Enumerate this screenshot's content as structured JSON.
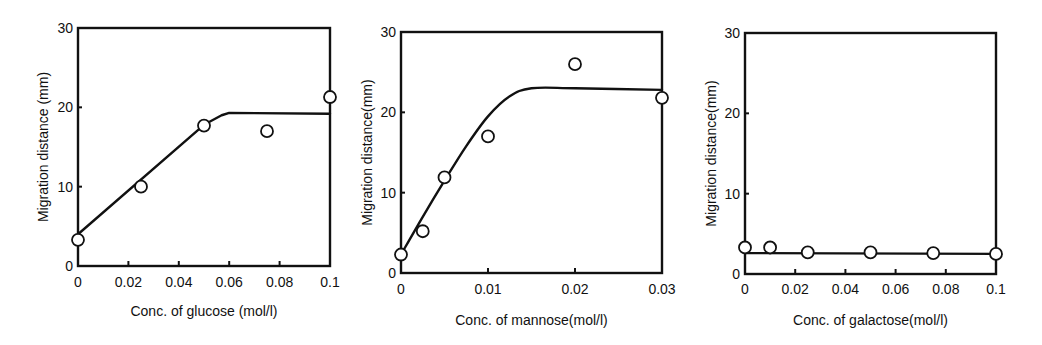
{
  "chart_data": [
    {
      "type": "scatter",
      "title": "",
      "xlabel": "Conc. of glucose (mol/l)",
      "ylabel": "Migration distance (mm)",
      "xlim": [
        0,
        0.1
      ],
      "ylim": [
        0,
        30
      ],
      "xticks": [
        0,
        0.02,
        0.04,
        0.06,
        0.08,
        0.1
      ],
      "xtick_labels": [
        "0",
        "0.02",
        "0.04",
        "0.06",
        "0.08",
        "0.1"
      ],
      "yticks": [
        0,
        10,
        20,
        30
      ],
      "ytick_labels": [
        "0",
        "10",
        "20",
        "30"
      ],
      "grid": false,
      "legend": null,
      "series": [
        {
          "name": "measured",
          "marker": "open-circle",
          "x": [
            0,
            0.025,
            0.05,
            0.075,
            0.1
          ],
          "y": [
            3.3,
            10.0,
            17.7,
            17.0,
            21.3
          ]
        },
        {
          "name": "fit",
          "style": "line",
          "x": [
            0,
            0.05,
            0.057,
            0.06,
            0.1
          ],
          "y": [
            4.0,
            17.8,
            19.0,
            19.3,
            19.2
          ]
        }
      ]
    },
    {
      "type": "scatter",
      "title": "",
      "xlabel": "Conc. of mannose(mol/l)",
      "ylabel": "Migration distance(mm)",
      "xlim": [
        0,
        0.03
      ],
      "ylim": [
        0,
        30
      ],
      "xticks": [
        0,
        0.01,
        0.02,
        0.03
      ],
      "xtick_labels": [
        "0",
        "0.01",
        "0.02",
        "0.03"
      ],
      "yticks": [
        0,
        10,
        20,
        30
      ],
      "ytick_labels": [
        "0",
        "10",
        "20",
        "30"
      ],
      "grid": false,
      "legend": null,
      "series": [
        {
          "name": "measured",
          "marker": "open-circle",
          "x": [
            0,
            0.0025,
            0.005,
            0.01,
            0.02,
            0.03
          ],
          "y": [
            2.3,
            5.2,
            11.9,
            17.0,
            26.0,
            21.8
          ]
        },
        {
          "name": "fit",
          "style": "curve",
          "x": [
            0,
            0.0025,
            0.005,
            0.0075,
            0.01,
            0.0125,
            0.015,
            0.02,
            0.03
          ],
          "y": [
            2.3,
            7.0,
            11.5,
            15.8,
            19.5,
            22.0,
            23.0,
            23.0,
            22.8
          ]
        }
      ]
    },
    {
      "type": "scatter",
      "title": "",
      "xlabel": "Conc. of galactose(mol/l)",
      "ylabel": "Migration distance(mm)",
      "xlim": [
        0,
        0.1
      ],
      "ylim": [
        0,
        30
      ],
      "xticks": [
        0,
        0.02,
        0.04,
        0.06,
        0.08,
        0.1
      ],
      "xtick_labels": [
        "0",
        "0.02",
        "0.04",
        "0.06",
        "0.08",
        "0.1"
      ],
      "yticks": [
        0,
        10,
        20,
        30
      ],
      "ytick_labels": [
        "0",
        "10",
        "20",
        "30"
      ],
      "grid": false,
      "legend": null,
      "series": [
        {
          "name": "measured",
          "marker": "open-circle",
          "x": [
            0,
            0.01,
            0.025,
            0.05,
            0.075,
            0.1
          ],
          "y": [
            3.3,
            3.3,
            2.7,
            2.7,
            2.6,
            2.5
          ]
        },
        {
          "name": "fit",
          "style": "line",
          "x": [
            0,
            0.1
          ],
          "y": [
            2.6,
            2.5
          ]
        }
      ]
    }
  ],
  "layout": {
    "panels": [
      {
        "left": 78,
        "top": 28,
        "right": 330,
        "bottom": 266,
        "ylabel_x": 48,
        "xlabel_y": 316,
        "xtick_y": 287
      },
      {
        "left": 401,
        "top": 32,
        "right": 662,
        "bottom": 273,
        "ylabel_x": 372,
        "xlabel_y": 325,
        "xtick_y": 294
      },
      {
        "left": 745,
        "top": 33,
        "right": 996,
        "bottom": 274,
        "ylabel_x": 716,
        "xlabel_y": 325,
        "xtick_y": 294
      }
    ]
  }
}
